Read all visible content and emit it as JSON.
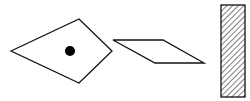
{
  "diagram": {
    "shapes": [
      {
        "type": "kite",
        "points": "11,51 79,19 112,51 79,83",
        "stroke": "#111111",
        "fill": "#ffffff"
      },
      {
        "type": "dot",
        "cx": 70,
        "cy": 51,
        "r": 5,
        "fill": "#000000"
      },
      {
        "type": "parallelogram",
        "points": "113,40 163,40 204,63 155,63",
        "stroke": "#111111",
        "fill": "#ffffff"
      },
      {
        "type": "hatched-rectangle",
        "x": 221,
        "y": 5,
        "width": 24,
        "height": 92,
        "stroke": "#111111",
        "hatch": "diagonal"
      }
    ]
  }
}
